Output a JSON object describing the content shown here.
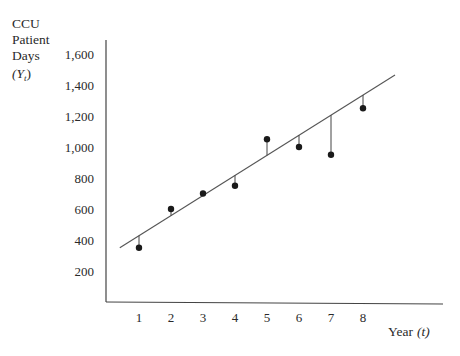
{
  "chart_data": {
    "type": "scatter",
    "title": "",
    "ylabel_lines": [
      "CCU",
      "Patient",
      "Days"
    ],
    "ylabel_symbol": "(Y",
    "ylabel_subscript": "t",
    "ylabel_close": ")",
    "xlabel": "Year",
    "xlabel_symbol": "(t)",
    "x_ticks": [
      "1",
      "2",
      "3",
      "4",
      "5",
      "6",
      "7",
      "8"
    ],
    "y_ticks": [
      "200",
      "400",
      "600",
      "800",
      "1,000",
      "1,200",
      "1,400",
      "1,600"
    ],
    "xlim": [
      0,
      10
    ],
    "ylim": [
      0,
      1700
    ],
    "grid": false,
    "legend": "none",
    "series": [
      {
        "name": "Observed CCU patient days",
        "x": [
          1,
          2,
          3,
          4,
          5,
          6,
          7,
          8
        ],
        "y": [
          350,
          600,
          700,
          750,
          1050,
          1000,
          950,
          1250
        ]
      }
    ],
    "trend_line": {
      "name": "Fitted linear trend",
      "x_start": 0.4,
      "y_start": 350,
      "x_end": 9.0,
      "y_end": 1465
    },
    "residual_lines": true
  }
}
